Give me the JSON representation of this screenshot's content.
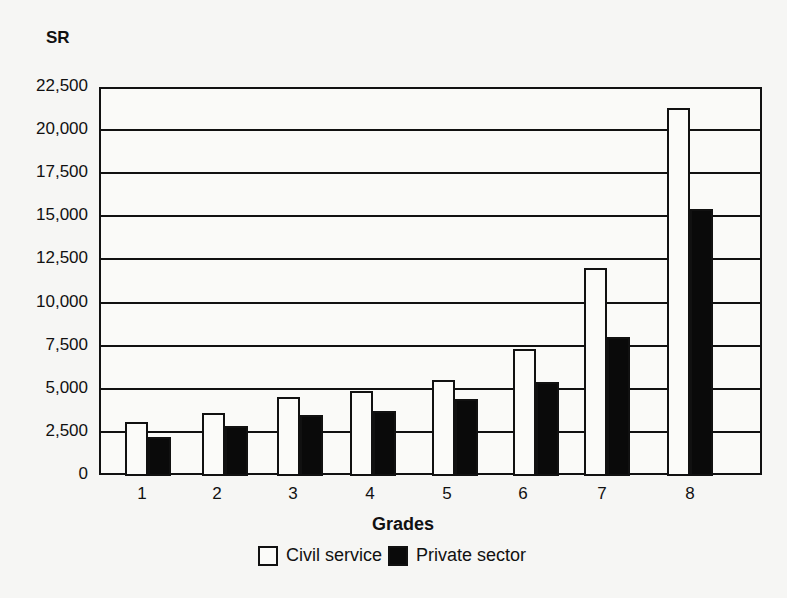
{
  "chart_data": {
    "type": "bar",
    "title": "",
    "unit_label": "SR",
    "xlabel": "Grades",
    "ylabel": "SR",
    "ylim": [
      0,
      22500
    ],
    "yticks": [
      0,
      2500,
      5000,
      7500,
      10000,
      12500,
      15000,
      17500,
      20000,
      22500
    ],
    "ytick_labels": [
      "0",
      "2,500",
      "5,000",
      "7,500",
      "10,000",
      "12,500",
      "15,000",
      "17,500",
      "20,000",
      "22,500"
    ],
    "grid": true,
    "legend_position": "bottom",
    "categories": [
      "1",
      "2",
      "3",
      "4",
      "5",
      "6",
      "7",
      "8"
    ],
    "series": [
      {
        "name": "Civil service",
        "color": "#ffffff",
        "values": [
          3100,
          3600,
          4500,
          4900,
          5500,
          7300,
          12000,
          21300
        ]
      },
      {
        "name": "Private sector",
        "color": "#000000",
        "values": [
          2200,
          2850,
          3500,
          3700,
          4400,
          5400,
          8000,
          15400
        ]
      }
    ]
  },
  "legend": {
    "civil_label": "Civil service",
    "private_label": "Private sector"
  }
}
